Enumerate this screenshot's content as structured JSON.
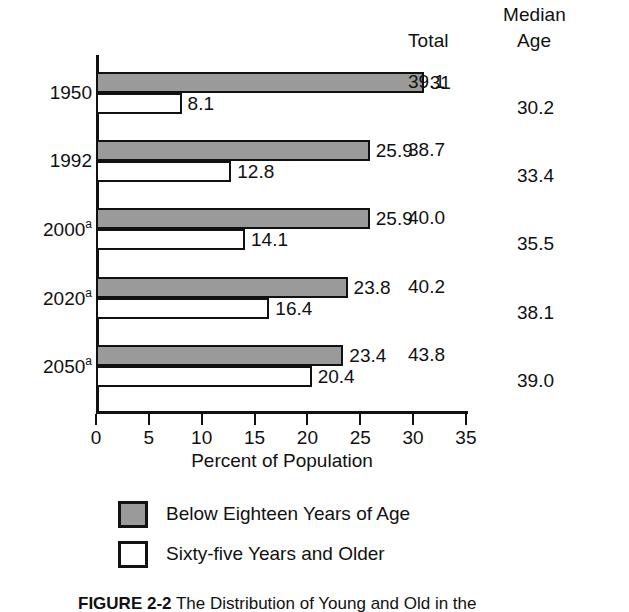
{
  "headers": {
    "median": "Median",
    "total": "Total",
    "age": "Age"
  },
  "axis_title": "Percent of Population",
  "legend": [
    {
      "key": "below",
      "label": "Below Eighteen Years of Age",
      "color": "#9a9a9a"
    },
    {
      "key": "older",
      "label": "Sixty-five Years and Older",
      "color": "#ffffff"
    }
  ],
  "caption": {
    "figure_number": "FIGURE 2-2",
    "text": "The Distribution of Young and Old in the"
  },
  "chart_data": {
    "type": "bar",
    "orientation": "horizontal",
    "title": "",
    "xlabel": "Percent of Population",
    "ylabel": "",
    "xlim": [
      0,
      35
    ],
    "xticks": [
      0,
      5,
      10,
      15,
      20,
      25,
      30,
      35
    ],
    "xticklabels": [
      "0",
      "5",
      "10",
      "15",
      "20",
      "25",
      "30",
      "35"
    ],
    "grid": false,
    "legend_position": "below-axis",
    "categories": [
      "1950",
      "1992",
      "2000",
      "2020",
      "2050"
    ],
    "category_labels": [
      "1950",
      "1992",
      "2000a",
      "2020a",
      "2050a"
    ],
    "category_footnotes": [
      "",
      "",
      "a",
      "a",
      "a"
    ],
    "series": [
      {
        "name": "Below Eighteen Years of Age",
        "color": "#9a9a9a",
        "values": [
          31,
          25.9,
          25.9,
          23.8,
          23.4
        ],
        "labels": [
          "31",
          "25.9",
          "25.9",
          "23.8",
          "23.4"
        ]
      },
      {
        "name": "Sixty-five Years and Older",
        "color": "#ffffff",
        "values": [
          8.1,
          12.8,
          14.1,
          16.4,
          20.4
        ],
        "labels": [
          "8.1",
          "12.8",
          "14.1",
          "16.4",
          "20.4"
        ]
      }
    ],
    "annotation_columns": [
      {
        "name": "Total",
        "values": [
          39.1,
          38.7,
          40.0,
          40.2,
          43.8
        ],
        "labels": [
          "39.1",
          "38.7",
          "40.0",
          "40.2",
          "43.8"
        ]
      },
      {
        "name": "Median Age",
        "values": [
          30.2,
          33.4,
          35.5,
          38.1,
          39.0
        ],
        "labels": [
          "30.2",
          "33.4",
          "35.5",
          "38.1",
          "39.0"
        ]
      }
    ]
  }
}
